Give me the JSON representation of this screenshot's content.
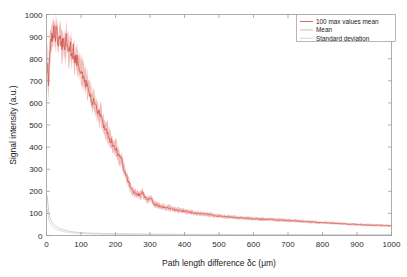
{
  "figure": {
    "background_color": "#ffffff",
    "axes_color": "#9a9a9a"
  },
  "chart_data": {
    "type": "line",
    "title": "",
    "xlabel": "Path length difference δc (μm)",
    "ylabel": "Signal intensity (a.u.)",
    "xlim": [
      0,
      1000
    ],
    "ylim": [
      0,
      1000
    ],
    "xticks": [
      0,
      100,
      200,
      300,
      400,
      500,
      600,
      700,
      800,
      900,
      1000
    ],
    "yticks": [
      0,
      100,
      200,
      300,
      400,
      500,
      600,
      700,
      800,
      900,
      1000
    ],
    "xticklabels": [
      "0",
      "100",
      "200",
      "300",
      "400",
      "500",
      "600",
      "700",
      "800",
      "900",
      "1000"
    ],
    "yticklabels": [
      "0",
      "100",
      "200",
      "300",
      "400",
      "500",
      "600",
      "700",
      "800",
      "900",
      "1000"
    ],
    "grid": false,
    "legend_position": "upper right",
    "colors": {
      "max_values_mean": "#d4564f",
      "mean": "#b9b9b9",
      "standard_deviation": "#cfcfcf"
    },
    "series": [
      {
        "name": "100 max values mean",
        "color": "#d4564f",
        "x": [
          2,
          6,
          10,
          14,
          18,
          22,
          26,
          30,
          34,
          38,
          42,
          46,
          50,
          54,
          58,
          62,
          66,
          70,
          74,
          78,
          82,
          86,
          90,
          94,
          98,
          104,
          110,
          116,
          122,
          128,
          134,
          140,
          146,
          152,
          158,
          164,
          170,
          176,
          182,
          188,
          194,
          200,
          206,
          212,
          218,
          224,
          230,
          236,
          242,
          248,
          254,
          260,
          266,
          272,
          278,
          284,
          290,
          296,
          302,
          308,
          314,
          320,
          330,
          340,
          350,
          360,
          370,
          380,
          390,
          400,
          415,
          430,
          445,
          460,
          475,
          490,
          505,
          520,
          535,
          550,
          565,
          580,
          595,
          610,
          625,
          640,
          655,
          670,
          685,
          700,
          720,
          740,
          760,
          780,
          800,
          820,
          840,
          860,
          880,
          900,
          920,
          940,
          960,
          980,
          1000
        ],
        "y": [
          780,
          700,
          840,
          905,
          880,
          930,
          900,
          935,
          870,
          905,
          880,
          860,
          870,
          845,
          905,
          855,
          830,
          850,
          820,
          835,
          805,
          800,
          790,
          775,
          760,
          735,
          700,
          690,
          660,
          640,
          600,
          600,
          575,
          545,
          540,
          500,
          480,
          470,
          440,
          425,
          400,
          400,
          375,
          350,
          345,
          300,
          275,
          250,
          225,
          205,
          195,
          190,
          185,
          180,
          195,
          175,
          165,
          160,
          170,
          150,
          140,
          138,
          132,
          128,
          126,
          122,
          118,
          115,
          112,
          110,
          105,
          102,
          99,
          96,
          93,
          90,
          87,
          85,
          83,
          81,
          79,
          78,
          76,
          75,
          74,
          73,
          72,
          70,
          69,
          68,
          66,
          64,
          62,
          60,
          58,
          57,
          55,
          53,
          51,
          50,
          48,
          47,
          46,
          45,
          44
        ],
        "band_low": [
          690,
          620,
          760,
          850,
          820,
          870,
          845,
          880,
          810,
          845,
          820,
          800,
          810,
          790,
          845,
          800,
          775,
          795,
          765,
          780,
          752,
          748,
          738,
          722,
          708,
          685,
          652,
          642,
          612,
          594,
          556,
          556,
          532,
          504,
          499,
          461,
          442,
          432,
          404,
          390,
          367,
          367,
          344,
          320,
          315,
          273,
          250,
          227,
          204,
          186,
          177,
          172,
          168,
          163,
          177,
          159,
          150,
          145,
          154,
          136,
          127,
          125,
          120,
          116,
          114,
          111,
          107,
          104,
          101,
          100,
          95,
          92,
          90,
          87,
          84,
          82,
          79,
          77,
          75,
          73,
          72,
          71,
          69,
          68,
          67,
          66,
          65,
          63,
          62,
          61,
          60,
          58,
          56,
          54,
          53,
          51,
          50,
          48,
          46,
          45,
          43,
          42,
          41,
          40,
          40
        ],
        "band_high": [
          870,
          780,
          920,
          960,
          940,
          985,
          955,
          990,
          930,
          965,
          940,
          920,
          930,
          900,
          965,
          910,
          885,
          905,
          875,
          890,
          858,
          852,
          842,
          828,
          812,
          785,
          748,
          738,
          708,
          686,
          644,
          644,
          618,
          586,
          581,
          539,
          518,
          508,
          476,
          460,
          433,
          433,
          406,
          380,
          375,
          327,
          300,
          273,
          246,
          224,
          213,
          208,
          202,
          197,
          213,
          191,
          180,
          175,
          186,
          164,
          153,
          151,
          144,
          140,
          138,
          133,
          129,
          126,
          123,
          120,
          115,
          112,
          108,
          105,
          102,
          98,
          95,
          93,
          91,
          89,
          86,
          85,
          83,
          82,
          81,
          80,
          79,
          77,
          76,
          75,
          72,
          70,
          68,
          66,
          63,
          63,
          60,
          58,
          56,
          55,
          53,
          52,
          51,
          50,
          48
        ]
      },
      {
        "name": "Mean",
        "color": "#b9b9b9",
        "x": [
          2,
          5,
          8,
          11,
          14,
          17,
          20,
          24,
          28,
          32,
          36,
          40,
          45,
          50,
          55,
          60,
          70,
          80,
          90,
          100,
          120,
          140,
          160,
          180,
          200,
          250,
          300,
          350,
          400,
          450,
          500,
          550,
          600,
          650,
          700,
          750,
          800,
          850,
          900,
          950,
          1000
        ],
        "y": [
          178,
          130,
          95,
          78,
          66,
          58,
          52,
          44,
          40,
          36,
          33,
          30,
          27,
          25,
          23,
          21,
          18,
          16,
          14,
          13,
          11,
          10,
          9,
          8,
          8,
          7,
          6,
          6,
          5,
          5,
          5,
          4,
          4,
          4,
          4,
          3,
          3,
          3,
          3,
          3,
          3
        ]
      },
      {
        "name": "Standard deviation",
        "color": "#cfcfcf",
        "x": [
          2,
          5,
          8,
          11,
          14,
          17,
          20,
          24,
          28,
          32,
          36,
          40,
          45,
          50,
          55,
          60,
          70,
          80,
          90,
          100,
          120,
          140,
          160,
          180,
          200,
          250,
          300,
          350,
          400,
          450,
          500,
          550,
          600,
          650,
          700,
          750,
          800,
          850,
          900,
          950,
          1000
        ],
        "y": [
          120,
          88,
          66,
          54,
          46,
          40,
          36,
          31,
          28,
          25,
          23,
          21,
          19,
          17,
          16,
          15,
          13,
          11,
          10,
          9,
          8,
          7,
          6,
          6,
          5,
          5,
          4,
          4,
          4,
          3,
          3,
          3,
          3,
          3,
          2,
          2,
          2,
          2,
          2,
          2,
          2
        ]
      }
    ],
    "legend_entries": [
      {
        "label": "100 max values mean",
        "color": "#d4564f"
      },
      {
        "label": "Mean",
        "color": "#b9b9b9"
      },
      {
        "label": "Standard deviation",
        "color": "#cfcfcf"
      }
    ]
  }
}
